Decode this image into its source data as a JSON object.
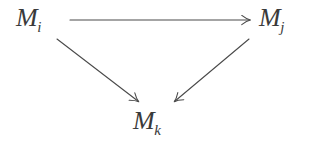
{
  "diagram": {
    "type": "commutative-triangle",
    "background_color": "#ffffff",
    "stroke_color": "#4a4a4a",
    "text_color": "#3a3a3a",
    "stroke_width": 1.1,
    "width": 309,
    "height": 150,
    "nodes": [
      {
        "id": "mi",
        "base": "M",
        "subscript": "i",
        "full_label": "M_i",
        "x": 16,
        "y": 5
      },
      {
        "id": "mj",
        "base": "M",
        "subscript": "j",
        "full_label": "M_j",
        "x": 259,
        "y": 5
      },
      {
        "id": "mk",
        "base": "M",
        "subscript": "k",
        "full_label": "M_k",
        "x": 133,
        "y": 108
      }
    ],
    "arrows": [
      {
        "id": "arrow-mi-mj",
        "from": "mi",
        "to": "mj",
        "orientation": "horizontal",
        "label": "",
        "x1": 70,
        "y1": 20,
        "x2": 253,
        "y2": 20
      },
      {
        "id": "arrow-mi-mk",
        "from": "mi",
        "to": "mk",
        "orientation": "diagonal-down-right",
        "label": "",
        "x1": 57,
        "y1": 39,
        "x2": 141,
        "y2": 104
      },
      {
        "id": "arrow-mj-mk",
        "from": "mj",
        "to": "mk",
        "orientation": "diagonal-down-left",
        "label": "",
        "x1": 249,
        "y1": 39,
        "x2": 172,
        "y2": 104
      }
    ]
  }
}
